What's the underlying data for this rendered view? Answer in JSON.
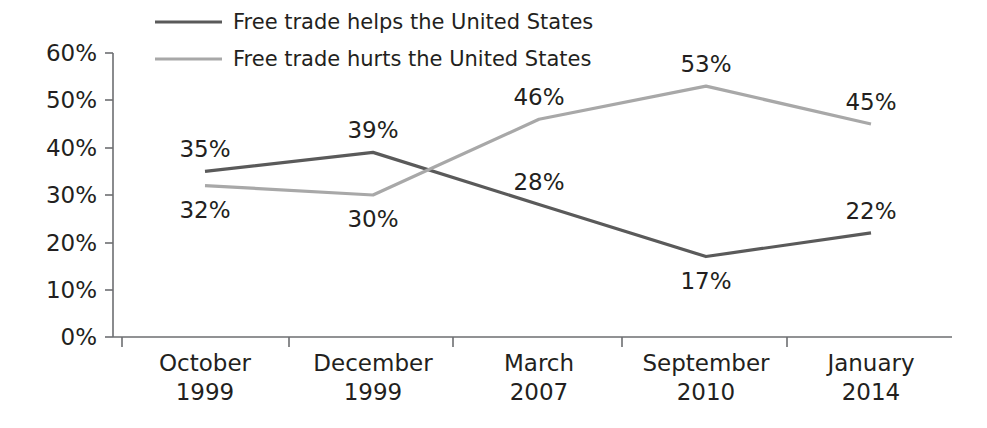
{
  "chart_data": {
    "type": "line",
    "title": "",
    "subtitle": "",
    "xlabel": "",
    "ylabel": "",
    "ylim": [
      0,
      60
    ],
    "ytick_values": [
      0,
      10,
      20,
      30,
      40,
      50,
      60
    ],
    "ytick_labels": [
      "0%",
      "10%",
      "20%",
      "30%",
      "40%",
      "50%",
      "60%"
    ],
    "grid": false,
    "legend_position": "top-left",
    "categories": [
      "October\n1999",
      "December\n1999",
      "March\n2007",
      "September\n2010",
      "January\n2014"
    ],
    "category_lines": [
      {
        "month": "October",
        "year": "1999"
      },
      {
        "month": "December",
        "year": "1999"
      },
      {
        "month": "March",
        "year": "2007"
      },
      {
        "month": "September",
        "year": "2010"
      },
      {
        "month": "January",
        "year": "2014"
      }
    ],
    "series": [
      {
        "name": "Free trade helps the United States",
        "color": "#5a5a5a",
        "values": [
          35,
          39,
          28,
          17,
          22
        ],
        "value_labels": [
          "35%",
          "39%",
          "28%",
          "17%",
          "22%"
        ],
        "label_side": [
          "above",
          "above",
          "above",
          "below",
          "above"
        ]
      },
      {
        "name": "Free trade hurts the United States",
        "color": "#a8a8a8",
        "values": [
          32,
          30,
          46,
          53,
          45
        ],
        "value_labels": [
          "32%",
          "30%",
          "46%",
          "53%",
          "45%"
        ],
        "label_side": [
          "below",
          "below",
          "above",
          "above",
          "above"
        ]
      }
    ]
  },
  "legend": {
    "items": [
      {
        "label": "Free trade helps the United States",
        "color": "#5a5a5a"
      },
      {
        "label": "Free trade hurts the United States",
        "color": "#a8a8a8"
      }
    ]
  },
  "axis": {
    "y_labels": [
      "60%",
      "50%",
      "40%",
      "30%",
      "20%",
      "10%",
      "0%"
    ],
    "x_labels_month": [
      "October",
      "December",
      "March",
      "September",
      "January"
    ],
    "x_labels_year": [
      "1999",
      "1999",
      "2007",
      "2010",
      "2014"
    ]
  },
  "colors": {
    "helps_line": "#5a5a5a",
    "hurts_line": "#a8a8a8",
    "axis": "#6d6e71",
    "text": "#231f20",
    "background": "#ffffff"
  }
}
